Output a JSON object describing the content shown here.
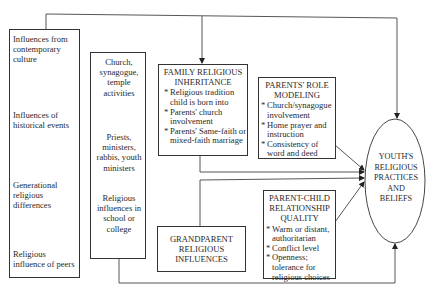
{
  "diagram": {
    "left_column": {
      "items": [
        "Influences from contemporary culture",
        "Influences of historical events",
        "Generational religious differences",
        "Religious influence of peers"
      ]
    },
    "middle_column": {
      "items": [
        "Church, synagogue, temple activities",
        "Priests, ministers, rabbis, youth ministers",
        "Religious influences in school or college"
      ]
    },
    "family_inheritance": {
      "title_line1": "FAMILY RELIGIOUS",
      "title_line2": "INHERITANCE",
      "bullets": [
        "Religious tradition child is born into",
        "Parents' church involvement",
        "Parents' Same-faith or mixed-faith marriage"
      ]
    },
    "role_modeling": {
      "title_line1": "PARENTS' ROLE",
      "title_line2": "MODELING",
      "bullets": [
        "Church/synagogue involvement",
        "Home prayer and instruction",
        "Consistency of word and deed"
      ]
    },
    "parent_child": {
      "title_line1": "PARENT-CHILD",
      "title_line2": "RELATIONSHIP",
      "title_line3": "QUALITY",
      "bullets": [
        "Warm or distant, authoritarian",
        "Conflict level",
        "Openness; tolerance for religious choices"
      ]
    },
    "grandparent": {
      "line1": "GRANDPARENT",
      "line2": "RELIGIOUS",
      "line3": "INFLUENCES"
    },
    "outcome": {
      "line1": "YOUTH'S",
      "line2": "RELIGIOUS",
      "line3": "PRACTICES",
      "line4": "AND",
      "line5": "BELIEFS"
    }
  }
}
